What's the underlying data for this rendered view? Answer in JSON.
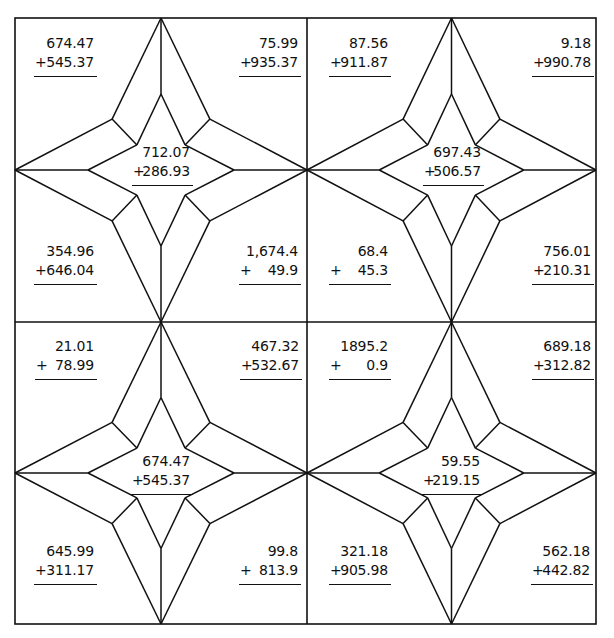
{
  "worksheet": {
    "title": "",
    "operator_symbol": "+",
    "line_color": "#111111",
    "grid": {
      "left": 15,
      "top": 18,
      "right": 596,
      "bottom": 624,
      "split_x": 307,
      "split_y": 322
    },
    "cells": [
      {
        "position": "top-left",
        "problems": {
          "top_left": {
            "a": "674.47",
            "b": "545.37"
          },
          "top_right": {
            "a": "75.99",
            "b": "935.37"
          },
          "center": {
            "a": "712.07",
            "b": "286.93"
          },
          "bottom_left": {
            "a": "354.96",
            "b": "646.04"
          },
          "bottom_right": {
            "a": "1,674.4",
            "b": "49.9"
          }
        }
      },
      {
        "position": "top-right",
        "problems": {
          "top_left": {
            "a": "87.56",
            "b": "911.87"
          },
          "top_right": {
            "a": "9.18",
            "b": "990.78"
          },
          "center": {
            "a": "697.43",
            "b": "506.57"
          },
          "bottom_left": {
            "a": "68.4",
            "b": "45.3"
          },
          "bottom_right": {
            "a": "756.01",
            "b": "210.31"
          }
        }
      },
      {
        "position": "bottom-left",
        "problems": {
          "top_left": {
            "a": "21.01",
            "b": "78.99"
          },
          "top_right": {
            "a": "467.32",
            "b": "532.67"
          },
          "center": {
            "a": "674.47",
            "b": "545.37"
          },
          "bottom_left": {
            "a": "645.99",
            "b": "311.17"
          },
          "bottom_right": {
            "a": "99.8",
            "b": "813.9"
          }
        }
      },
      {
        "position": "bottom-right",
        "problems": {
          "top_left": {
            "a": "1895.2",
            "b": "0.9"
          },
          "top_right": {
            "a": "689.18",
            "b": "312.82"
          },
          "center": {
            "a": "59.55",
            "b": "219.15"
          },
          "bottom_left": {
            "a": "321.18",
            "b": "905.98"
          },
          "bottom_right": {
            "a": "562.18",
            "b": "442.82"
          }
        }
      }
    ]
  }
}
